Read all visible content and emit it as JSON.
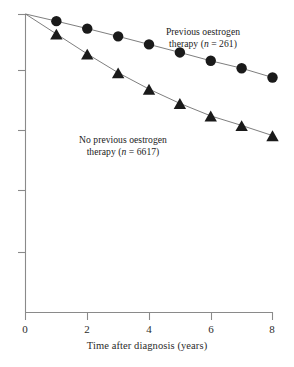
{
  "chart_data": {
    "type": "line",
    "title": "",
    "subtitle": "",
    "xlabel": "Time after diagnosis (years)",
    "ylabel": "",
    "xlim": [
      0,
      8
    ],
    "ylim": [
      0,
      1
    ],
    "xticks": [
      0,
      2,
      4,
      6,
      8
    ],
    "xticklabels": [
      "0",
      "2",
      "4",
      "6",
      "8"
    ],
    "yticks": [
      1.0,
      0.8,
      0.6,
      0.4,
      0.2,
      0.0
    ],
    "yticklabels": [
      "",
      "",
      "",
      "",
      "",
      ""
    ],
    "grid": false,
    "legend_position": "inline-annotations",
    "series": [
      {
        "name": "Previous oestrogen therapy (n = 261)",
        "marker": "circle",
        "color": "#1a1a1a",
        "x": [
          0,
          1,
          2,
          3,
          4,
          5,
          6,
          7,
          8
        ],
        "y": [
          1.0,
          0.976,
          0.951,
          0.925,
          0.898,
          0.871,
          0.843,
          0.818,
          0.787
        ]
      },
      {
        "name": "No previous oestrogen therapy (n = 6617)",
        "marker": "triangle",
        "color": "#1a1a1a",
        "x": [
          0,
          1,
          2,
          3,
          4,
          5,
          6,
          7,
          8
        ],
        "y": [
          1.0,
          0.933,
          0.866,
          0.803,
          0.748,
          0.7,
          0.658,
          0.626,
          0.592
        ]
      }
    ],
    "annotations": [
      {
        "id": "previous",
        "line1": "Previous oestrogen",
        "line2_prefix": "therapy (",
        "line2_italic": "n",
        "line2_suffix": " = 261)"
      },
      {
        "id": "no-previous",
        "line1": "No previous oestrogen",
        "line2_prefix": "therapy (",
        "line2_italic": "n",
        "line2_suffix": " = 6617)"
      }
    ]
  },
  "axes": {
    "x_tick_labels": {
      "t0": "0",
      "t2": "2",
      "t4": "4",
      "t6": "6",
      "t8": "8"
    },
    "x_axis_title": "Time after diagnosis (years)"
  },
  "colors": {
    "axis": "#8a8a8a",
    "marker": "#1a1a1a",
    "line": "#6f6f6f",
    "text": "#222222",
    "background": "#ffffff"
  }
}
